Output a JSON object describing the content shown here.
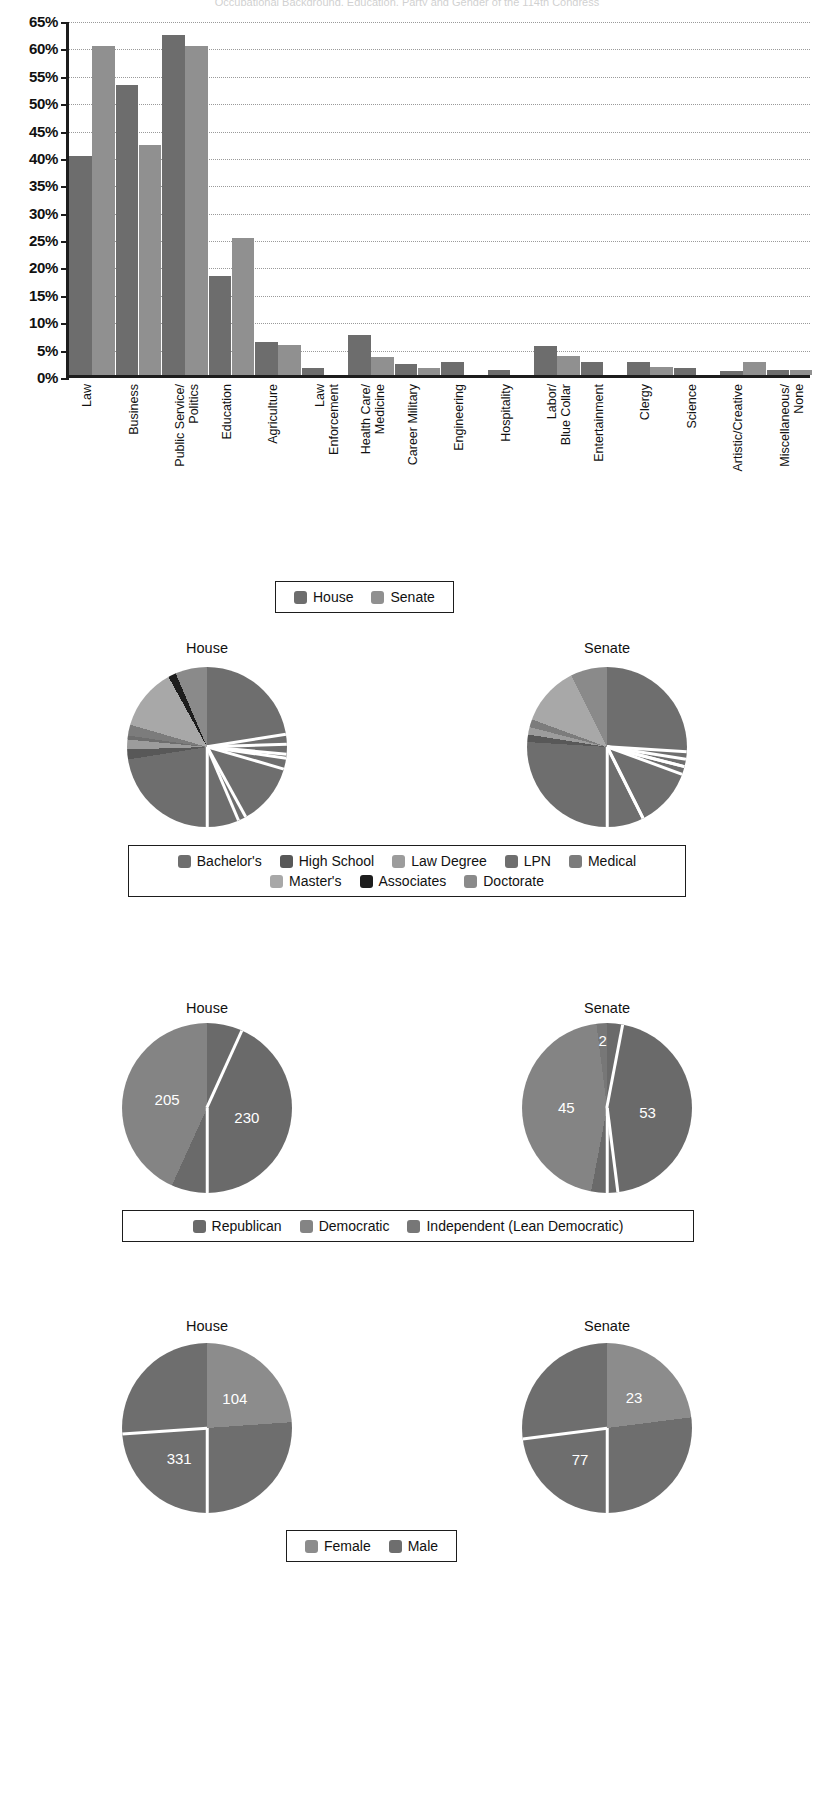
{
  "page": {
    "title": "Occupational Background, Education, Party and Gender of the 114th Congress"
  },
  "chart_data": [
    {
      "type": "bar",
      "title": "Occupational Background, Education, Party and Gender of the 114th Congress",
      "xlabel": "",
      "ylabel": "",
      "ylim": [
        0,
        65
      ],
      "ytick_labels": [
        "0%",
        "5%",
        "10%",
        "15%",
        "20%",
        "25%",
        "30%",
        "35%",
        "40%",
        "45%",
        "50%",
        "55%",
        "60%",
        "65%"
      ],
      "ytick_values": [
        0,
        5,
        10,
        15,
        20,
        25,
        30,
        35,
        40,
        45,
        50,
        55,
        60,
        65
      ],
      "grid": true,
      "legend_position": "bottom",
      "categories": [
        "Law",
        "Business",
        "Public Service/\nPolitics",
        "Education",
        "Agriculture",
        "Law\nEnforcement",
        "Health Care/\nMedicine",
        "Career Military",
        "Engineering",
        "Hospitality",
        "Labor/\nBlue Collar",
        "Entertainment",
        "Clergy",
        "Science",
        "Artistic/Creative",
        "Miscellaneous/\nNone"
      ],
      "series": [
        {
          "name": "House",
          "color": "#6d6d6d",
          "values": [
            40,
            53,
            62,
            18,
            6,
            1.3,
            7.3,
            2,
            2.3,
            1,
            5.3,
            2.3,
            2.3,
            1.2,
            0.7,
            1
          ]
        },
        {
          "name": "Senate",
          "color": "#909090",
          "values": [
            60,
            42,
            60,
            25,
            5.5,
            0,
            3.2,
            1.2,
            0,
            0,
            3.5,
            0,
            1.5,
            0,
            2.4,
            1
          ]
        }
      ]
    },
    {
      "type": "pie",
      "title": "Education",
      "panels": [
        {
          "name": "House",
          "labels": [
            "Bachelor's",
            "High School",
            "Law Degree",
            "LPN",
            "Medical",
            "Master's",
            "Associates",
            "Doctorate"
          ],
          "values": [
            72.5,
            2.0,
            2.0,
            0.8,
            2.2,
            12.5,
            1.6,
            6.4
          ]
        },
        {
          "name": "Senate",
          "labels": [
            "Bachelor's",
            "High School",
            "Law Degree",
            "LPN",
            "Medical",
            "Master's",
            "Associates",
            "Doctorate"
          ],
          "values": [
            76.0,
            1.5,
            1.5,
            0.0,
            1.6,
            12.0,
            0.0,
            7.4
          ]
        }
      ],
      "legend": [
        {
          "label": "Bachelor's",
          "color": "#6e6e6e"
        },
        {
          "label": "High School",
          "color": "#585858"
        },
        {
          "label": "Law Degree",
          "color": "#9c9c9c"
        },
        {
          "label": "LPN",
          "color": "#6e6e6e"
        },
        {
          "label": "Medical",
          "color": "#7c7c7c"
        },
        {
          "label": "Master's",
          "color": "#a8a8a8"
        },
        {
          "label": "Associates",
          "color": "#1d1d1d"
        },
        {
          "label": "Doctorate",
          "color": "#8a8a8a"
        }
      ],
      "legend_position": "bottom"
    },
    {
      "type": "pie",
      "title": "Party",
      "panels": [
        {
          "name": "House",
          "labels": [
            "Republican",
            "Democratic"
          ],
          "values": [
            247,
            188
          ],
          "data_labels": [
            "230",
            "205"
          ]
        },
        {
          "name": "Senate",
          "labels": [
            "Republican",
            "Democratic",
            "Independent (Lean Democratic)"
          ],
          "values": [
            53,
            45,
            2
          ],
          "data_labels": [
            "53",
            "45",
            "2"
          ]
        }
      ],
      "legend": [
        {
          "label": "Republican",
          "color": "#6a6a6a"
        },
        {
          "label": "Democratic",
          "color": "#848484"
        },
        {
          "label": "Independent (Lean Democratic)",
          "color": "#777777"
        }
      ],
      "legend_position": "bottom"
    },
    {
      "type": "pie",
      "title": "Gender",
      "panels": [
        {
          "name": "House",
          "labels": [
            "Female",
            "Male"
          ],
          "values": [
            104,
            331
          ],
          "data_labels": [
            "104",
            "331"
          ]
        },
        {
          "name": "Senate",
          "labels": [
            "Female",
            "Male"
          ],
          "values": [
            23,
            77
          ],
          "data_labels": [
            "23",
            "77"
          ]
        }
      ],
      "legend": [
        {
          "label": "Female",
          "color": "#8c8c8c"
        },
        {
          "label": "Male",
          "color": "#6e6e6e"
        }
      ],
      "legend_position": "bottom"
    }
  ],
  "bar_legend": [
    {
      "label": "House",
      "color": "#6d6d6d"
    },
    {
      "label": "Senate",
      "color": "#909090"
    }
  ],
  "panel_headings": {
    "house": "House",
    "senate": "Senate"
  }
}
